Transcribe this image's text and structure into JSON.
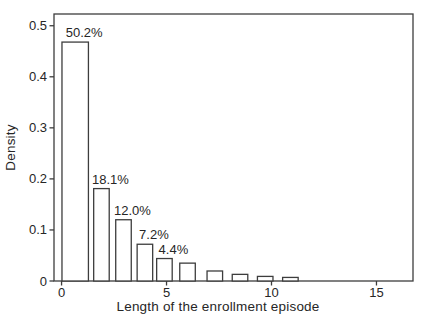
{
  "chart_data": {
    "type": "histogram",
    "title": "",
    "xlabel": "Length of the enrollment episode",
    "ylabel": "Density",
    "x_ticks": [
      0,
      5,
      10,
      15
    ],
    "x_tick_labels": [
      "0",
      "5",
      "10",
      "15"
    ],
    "y_ticks": [
      0,
      0.1,
      0.2,
      0.3,
      0.4,
      0.5
    ],
    "y_tick_labels": [
      "0",
      "0.1",
      "0.2",
      "0.3",
      "0.4",
      "0.5"
    ],
    "xlim": [
      -0.36,
      16.74
    ],
    "ylim": [
      0,
      0.523
    ],
    "grid": false,
    "legend": "none",
    "bars": [
      {
        "x_center": 0.65,
        "width": 1.26,
        "density": 0.468,
        "label": "50.2%"
      },
      {
        "x_center": 1.9,
        "width": 0.74,
        "density": 0.181,
        "label": "18.1%"
      },
      {
        "x_center": 2.95,
        "width": 0.74,
        "density": 0.12,
        "label": "12.0%"
      },
      {
        "x_center": 3.97,
        "width": 0.74,
        "density": 0.072,
        "label": "7.2%"
      },
      {
        "x_center": 4.9,
        "width": 0.74,
        "density": 0.044,
        "label": "4.4%"
      },
      {
        "x_center": 6.0,
        "width": 0.74,
        "density": 0.035,
        "label": ""
      },
      {
        "x_center": 7.3,
        "width": 0.74,
        "density": 0.0196,
        "label": ""
      },
      {
        "x_center": 8.5,
        "width": 0.74,
        "density": 0.013,
        "label": ""
      },
      {
        "x_center": 9.7,
        "width": 0.74,
        "density": 0.009,
        "label": ""
      },
      {
        "x_center": 10.9,
        "width": 0.74,
        "density": 0.007,
        "label": ""
      }
    ],
    "colors": {
      "stroke": "#3d3d3d",
      "bar_fill": "#ffffff",
      "text": "#262626",
      "background": "#ffffff"
    }
  }
}
